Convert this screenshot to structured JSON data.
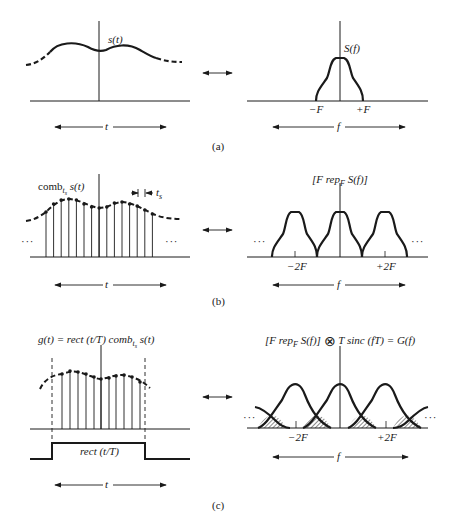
{
  "figure": {
    "panels": [
      {
        "id": "a",
        "caption": "(a)",
        "left": {
          "signal_label": "s(t)",
          "axis_label": "t"
        },
        "right": {
          "signal_label": "S(f)",
          "tick_neg": "−F",
          "tick_pos": "+F",
          "axis_label": "f"
        }
      },
      {
        "id": "b",
        "caption": "(b)",
        "left": {
          "signal_prefix": "comb",
          "signal_sub": "t",
          "signal_subsub": "s",
          "signal_suffix": "s(t)",
          "spacing_label": "t",
          "spacing_sub": "s",
          "ellipsis": "· · ·",
          "axis_label": "t"
        },
        "right": {
          "signal_label_pre": "[F rep",
          "signal_label_sub": "F",
          "signal_label_post": " S(f)]",
          "tick_neg": "−2F",
          "tick_pos": "+2F",
          "ellipsis": "· · ·",
          "axis_label": "f"
        }
      },
      {
        "id": "c",
        "caption": "(c)",
        "left": {
          "signal_pre": "g(t) = rect (t/T) comb",
          "signal_sub": "t",
          "signal_subsub": "s",
          "signal_post": " s(t)",
          "rect_label": "rect (t/T)",
          "axis_label": "t"
        },
        "right": {
          "signal_pre": "[F rep",
          "signal_sub": "F",
          "signal_mid": " S(f)] ",
          "conv_symbol": "⊗",
          "signal_post": " T sinc (fT) = G(f)",
          "tick_neg": "−2F",
          "tick_pos": "+2F",
          "ellipsis": "· · ·",
          "axis_label": "f"
        }
      }
    ],
    "transform_arrow": "↔"
  }
}
